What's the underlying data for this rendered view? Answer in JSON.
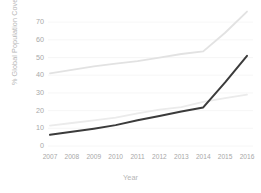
{
  "chart_data": {
    "type": "line",
    "title": "",
    "subtitle": "",
    "xlabel": "Year",
    "ylabel": "% Global Population Covered",
    "categories": [
      "2007",
      "2008",
      "2009",
      "2010",
      "2011",
      "2012",
      "2013",
      "2014",
      "2015",
      "2016"
    ],
    "x": [
      2007,
      2008,
      2009,
      2010,
      2011,
      2012,
      2013,
      2014,
      2015,
      2016
    ],
    "xlim": [
      2007,
      2016
    ],
    "ylim": [
      0,
      78
    ],
    "yticks": [
      0,
      10,
      20,
      30,
      40,
      50,
      60,
      70
    ],
    "ytick_labels": [
      "0",
      "10",
      "20",
      "30",
      "40",
      "50",
      "60",
      "70"
    ],
    "grid": true,
    "grid_axis": "y",
    "legend": false,
    "legend_position": "none",
    "series": [
      {
        "name": "Upper coverage series",
        "color": "#e2e2e2",
        "values": [
          41,
          43,
          45,
          46.5,
          48,
          50,
          52,
          53.5,
          64,
          76
        ]
      },
      {
        "name": "Middle coverage series",
        "color": "#ebebeb",
        "values": [
          11.5,
          13,
          14.5,
          16,
          18.5,
          20.5,
          22,
          25,
          27,
          29
        ]
      },
      {
        "name": "Lower coverage series",
        "color": "#3b3b3b",
        "values": [
          6.3,
          8,
          9.8,
          11.8,
          14.5,
          17,
          19.5,
          21.8,
          36,
          51
        ]
      }
    ]
  }
}
